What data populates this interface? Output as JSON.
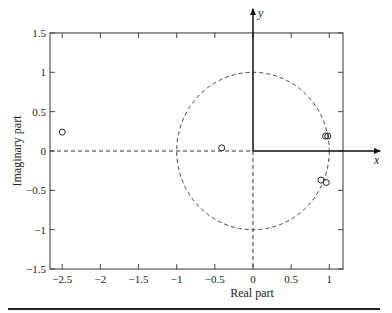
{
  "chart_data": {
    "type": "scatter",
    "title": "",
    "xlabel": "Real part",
    "ylabel": "Imaginary part",
    "xlim": [
      -2.65,
      1.2
    ],
    "ylim": [
      -1.5,
      1.5
    ],
    "xticks": [
      -2.5,
      -2,
      -1.5,
      -1,
      -0.5,
      0,
      0.5,
      1
    ],
    "xtick_labels": [
      "−2.5",
      "−2",
      "−1.5",
      "−1",
      "−0.5",
      "0",
      "0.5",
      "1"
    ],
    "yticks": [
      1.5,
      1,
      0.5,
      0,
      -0.5,
      -1,
      -1.5
    ],
    "ytick_labels": [
      "1.5",
      "1",
      "0.5",
      "0",
      "−0.5",
      "−1",
      "−1.5"
    ],
    "grid": false,
    "legend": null,
    "marker": "open-circle",
    "series": [
      {
        "name": "zeros",
        "points": [
          {
            "x": -2.5,
            "y": 0.24
          },
          {
            "x": -0.41,
            "y": 0.04
          },
          {
            "x": 0.95,
            "y": 0.19
          },
          {
            "x": 0.98,
            "y": 0.19
          },
          {
            "x": 0.89,
            "y": -0.37
          },
          {
            "x": 0.96,
            "y": -0.4
          }
        ]
      }
    ],
    "annotations": {
      "unit_circle": {
        "center": [
          0,
          0
        ],
        "radius": 1,
        "style": "dashed"
      },
      "x_axis_arrow_label": "x",
      "y_axis_arrow_label": "y",
      "dashed_lines": [
        "real axis y=0 (left of origin)",
        "imaginary axis x=0 (below origin)"
      ]
    }
  }
}
